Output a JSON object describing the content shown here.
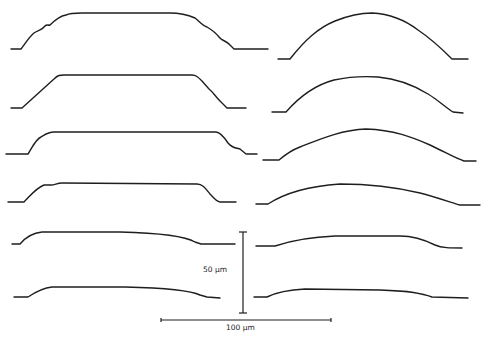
{
  "figure": {
    "columns": [
      {
        "name": "left",
        "profile_shape": "flat-topped trapezoid",
        "profiles": [
          {
            "id": "L1",
            "shape": "flat top with stepped shoulders"
          },
          {
            "id": "L2",
            "shape": "flat top with straight sloped sides"
          },
          {
            "id": "L3",
            "shape": "flat top with steep sides"
          },
          {
            "id": "L4",
            "shape": "flat top with small shoulder step"
          },
          {
            "id": "L5",
            "shape": "low, slightly rounded flat top"
          },
          {
            "id": "L6",
            "shape": "low, slightly rounded flat top"
          }
        ]
      },
      {
        "name": "right",
        "profile_shape": "rounded dome",
        "profiles": [
          {
            "id": "R1",
            "shape": "tall dome"
          },
          {
            "id": "R2",
            "shape": "dome"
          },
          {
            "id": "R3",
            "shape": "broad dome"
          },
          {
            "id": "R4",
            "shape": "shallow dome"
          },
          {
            "id": "R5",
            "shape": "low flattened dome"
          },
          {
            "id": "R6",
            "shape": "low flattened dome"
          }
        ]
      }
    ],
    "scale_bars": {
      "vertical": {
        "label": "50 µm",
        "value": 50,
        "unit": "µm"
      },
      "horizontal": {
        "label": "100 µm",
        "value": 100,
        "unit": "µm"
      }
    },
    "colors": {
      "ink": "#1e1e1e",
      "background": "#ffffff"
    }
  }
}
